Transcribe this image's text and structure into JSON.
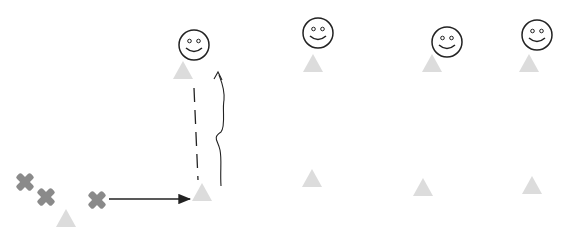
{
  "diagram": {
    "colors": {
      "triangle": "#dcdcdc",
      "cross": "#8a8a8a",
      "line": "#222222",
      "background": "#ffffff"
    },
    "smileys": [
      {
        "id": "smiley-1",
        "cx": 194,
        "cy": 45,
        "r": 15
      },
      {
        "id": "smiley-2",
        "cx": 318,
        "cy": 33,
        "r": 15
      },
      {
        "id": "smiley-3",
        "cx": 447,
        "cy": 42,
        "r": 15
      },
      {
        "id": "smiley-4",
        "cx": 537,
        "cy": 35,
        "r": 15
      }
    ],
    "triangles": [
      {
        "id": "cone-top-1",
        "cx": 183,
        "cy": 70
      },
      {
        "id": "cone-top-2",
        "cx": 313,
        "cy": 63
      },
      {
        "id": "cone-top-3",
        "cx": 432,
        "cy": 63
      },
      {
        "id": "cone-top-4",
        "cx": 529,
        "cy": 63
      },
      {
        "id": "cone-bottom-1",
        "cx": 202,
        "cy": 192
      },
      {
        "id": "cone-bottom-2",
        "cx": 312,
        "cy": 178
      },
      {
        "id": "cone-bottom-3",
        "cx": 423,
        "cy": 187
      },
      {
        "id": "cone-bottom-4",
        "cx": 532,
        "cy": 185
      },
      {
        "id": "cone-left",
        "cx": 66,
        "cy": 218
      }
    ],
    "crosses": [
      {
        "id": "cross-1",
        "cx": 25,
        "cy": 182
      },
      {
        "id": "cross-2",
        "cx": 46,
        "cy": 197
      },
      {
        "id": "cross-3",
        "cx": 97,
        "cy": 200
      }
    ],
    "arrows": [
      {
        "id": "pass-arrow",
        "x1": 109,
        "y1": 199,
        "x2": 190,
        "y2": 199,
        "style": "solid"
      }
    ]
  }
}
